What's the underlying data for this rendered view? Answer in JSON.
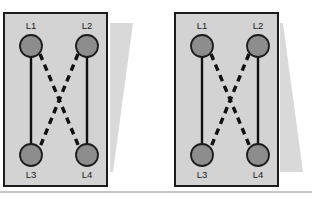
{
  "figure": {
    "title": "",
    "canvas": {
      "width": 312,
      "height": 198,
      "background": "#ffffff"
    },
    "colors": {
      "panel_fill": "#d3d3d3",
      "panel_border": "#1c1c1c",
      "node_fill": "#8d8d8d",
      "node_stroke": "#1c1c1c",
      "edge_solid": "#111111",
      "edge_dashed": "#111111",
      "wedge_fill": "#d9d9d9",
      "rule_color": "#8c8c8c",
      "label_color": "#1a1a1a"
    },
    "panels": [
      {
        "id": "panel-left",
        "name": "left-diagram-panel",
        "box": {
          "x": 4,
          "y": 13,
          "width": 103,
          "height": 173
        },
        "nodes": [
          {
            "id": "L1",
            "label": "L1",
            "cx": 31,
            "cy": 46,
            "r": 11,
            "label_x": 31,
            "label_y": 26
          },
          {
            "id": "L2",
            "label": "L2",
            "cx": 87,
            "cy": 46,
            "r": 11,
            "label_x": 87,
            "label_y": 26
          },
          {
            "id": "L3",
            "label": "L3",
            "cx": 31,
            "cy": 155,
            "r": 11,
            "label_x": 31,
            "label_y": 175
          },
          {
            "id": "L4",
            "label": "L4",
            "cx": 87,
            "cy": 155,
            "r": 11,
            "label_x": 87,
            "label_y": 175
          }
        ],
        "edges": [
          {
            "id": "L1-L3",
            "from": "L1",
            "to": "L3",
            "style": "solid",
            "x1": 31,
            "y1": 57,
            "x2": 31,
            "y2": 144
          },
          {
            "id": "L2-L4",
            "from": "L2",
            "to": "L4",
            "style": "solid",
            "x1": 87,
            "y1": 57,
            "x2": 87,
            "y2": 144
          },
          {
            "id": "L1-L4",
            "from": "L1",
            "to": "L4",
            "style": "dashed",
            "x1": 40,
            "y1": 54,
            "x2": 79,
            "y2": 147
          },
          {
            "id": "L2-L3",
            "from": "L2",
            "to": "L3",
            "style": "dashed",
            "x1": 78,
            "y1": 54,
            "x2": 40,
            "y2": 147
          }
        ],
        "wedge": {
          "id": "wedge-left",
          "orientation": "wide-top",
          "points": "110,23 133,23 113,172 110,172"
        }
      },
      {
        "id": "panel-right",
        "name": "right-diagram-panel",
        "box": {
          "x": 175,
          "y": 13,
          "width": 103,
          "height": 173
        },
        "nodes": [
          {
            "id": "L1",
            "label": "L1",
            "cx": 202,
            "cy": 46,
            "r": 11,
            "label_x": 202,
            "label_y": 26
          },
          {
            "id": "L2",
            "label": "L2",
            "cx": 258,
            "cy": 46,
            "r": 11,
            "label_x": 258,
            "label_y": 26
          },
          {
            "id": "L3",
            "label": "L3",
            "cx": 202,
            "cy": 155,
            "r": 11,
            "label_x": 202,
            "label_y": 175
          },
          {
            "id": "L4",
            "label": "L4",
            "cx": 258,
            "cy": 155,
            "r": 11,
            "label_x": 258,
            "label_y": 175
          }
        ],
        "edges": [
          {
            "id": "L1-L3",
            "from": "L1",
            "to": "L3",
            "style": "solid",
            "x1": 202,
            "y1": 57,
            "x2": 202,
            "y2": 144
          },
          {
            "id": "L2-L4",
            "from": "L2",
            "to": "L4",
            "style": "solid",
            "x1": 258,
            "y1": 57,
            "x2": 258,
            "y2": 144
          },
          {
            "id": "L1-L4",
            "from": "L1",
            "to": "L4",
            "style": "dashed",
            "x1": 211,
            "y1": 54,
            "x2": 250,
            "y2": 147
          },
          {
            "id": "L2-L3",
            "from": "L2",
            "to": "L3",
            "style": "dashed",
            "x1": 249,
            "y1": 54,
            "x2": 211,
            "y2": 147
          }
        ],
        "wedge": {
          "id": "wedge-right",
          "orientation": "wide-bottom",
          "points": "280,23 283,23 303,172 280,172"
        }
      }
    ],
    "bottom_rule": {
      "x1": 0,
      "y1": 192,
      "x2": 312,
      "y2": 192
    }
  }
}
